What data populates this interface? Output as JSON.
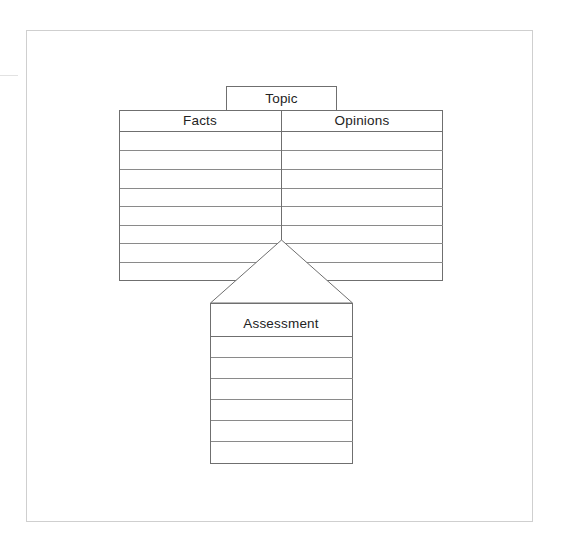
{
  "worksheet": {
    "type": "graphic-organizer",
    "layout": "fact-opinion-assessment",
    "frame": {
      "border_color": "#cfcfcf",
      "background": "#ffffff"
    },
    "line_color": "#6f6f6f",
    "text_color": "#232323"
  },
  "topic_box": {
    "label": "Topic",
    "rows": 1
  },
  "main_table": {
    "columns": [
      {
        "header": "Facts",
        "cells": [
          "",
          "",
          "",
          "",
          "",
          "",
          "",
          ""
        ]
      },
      {
        "header": "Opinions",
        "cells": [
          "",
          "",
          "",
          "",
          "",
          "",
          "",
          ""
        ]
      }
    ],
    "row_count": 8,
    "has_center_divider": true
  },
  "arrow": {
    "shape": "triangle-up",
    "points_to": "Assessment"
  },
  "assessment_box": {
    "header": "Assessment",
    "cells": [
      "",
      "",
      "",
      "",
      "",
      ""
    ],
    "row_count": 6
  }
}
